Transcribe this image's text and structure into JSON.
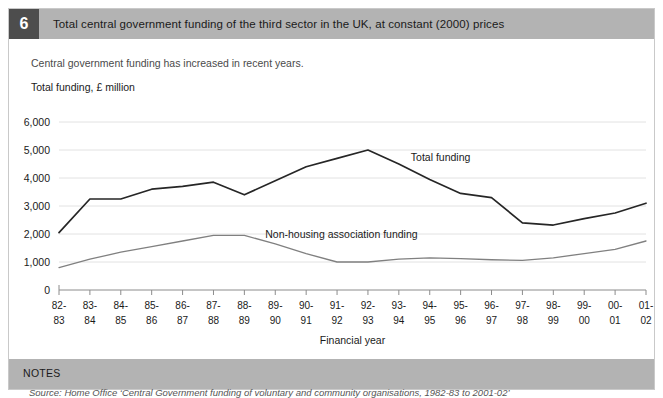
{
  "figure": {
    "number": "6",
    "title": "Total central government funding of the third sector in the UK, at constant (2000) prices",
    "subtitle": "Central government funding has increased in recent years.",
    "source": "Source: Home Office ‘Central Government funding of voluntary and community organisations, 1982-83 to 2001-02’",
    "notes_label": "NOTES"
  },
  "colors": {
    "header_band": "#b3b3b3",
    "number_box": "#4d4d4d",
    "total_funding_line": "#262626",
    "non_housing_line": "#808080",
    "gridline": "#e2e2e2",
    "axis": "#8c8c8c"
  },
  "chart_data": {
    "type": "line",
    "title": "Total central government funding of the third sector in the UK, at constant (2000) prices",
    "subtitle": "Central government funding has increased in recent years.",
    "ylabel": "Total funding, £ million",
    "xlabel": "Financial year",
    "ylim": [
      0,
      6000
    ],
    "ytick_values": [
      0,
      1000,
      2000,
      3000,
      4000,
      5000,
      6000
    ],
    "ytick_labels": [
      "0",
      "1,000",
      "2,000",
      "3,000",
      "4,000",
      "5,000",
      "6,000"
    ],
    "grid": true,
    "legend_position": "inline-annotations",
    "categories": [
      "82-83",
      "83-84",
      "84-85",
      "85-86",
      "86-87",
      "87-88",
      "88-89",
      "89-90",
      "90-91",
      "91-92",
      "92-93",
      "93-94",
      "94-95",
      "95-96",
      "96-97",
      "97-98",
      "98-99",
      "99-00",
      "00-01",
      "01-02"
    ],
    "tick_labels_top": [
      "82-",
      "83-",
      "84-",
      "85-",
      "86-",
      "87-",
      "88-",
      "89-",
      "90-",
      "91-",
      "92-",
      "93-",
      "94-",
      "95-",
      "96-",
      "97-",
      "98-",
      "99-",
      "00-",
      "01-"
    ],
    "tick_labels_bottom": [
      "83",
      "84",
      "85",
      "86",
      "87",
      "88",
      "89",
      "90",
      "91",
      "92",
      "93",
      "94",
      "95",
      "96",
      "97",
      "98",
      "99",
      "00",
      "01",
      "02"
    ],
    "series": [
      {
        "name": "Total funding",
        "color": "#262626",
        "values": [
          2050,
          3250,
          3250,
          3600,
          3700,
          3850,
          3400,
          3900,
          4400,
          4700,
          5000,
          4500,
          3950,
          3450,
          3300,
          2400,
          2320,
          2550,
          2750,
          3100
        ]
      },
      {
        "name": "Non-housing association funding",
        "color": "#808080",
        "values": [
          800,
          1100,
          1350,
          1550,
          1750,
          1950,
          1950,
          1650,
          1300,
          1000,
          1000,
          1100,
          1150,
          1120,
          1080,
          1060,
          1150,
          1300,
          1450,
          1750
        ]
      }
    ],
    "annotations": [
      {
        "text": "Total funding",
        "series": "Total funding"
      },
      {
        "text": "Non-housing association funding",
        "series": "Non-housing association funding"
      }
    ]
  }
}
